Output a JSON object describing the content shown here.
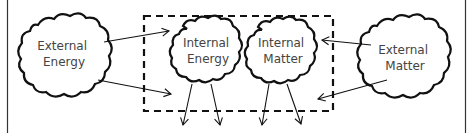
{
  "diagram": {
    "nodes": [
      {
        "id": "external-energy",
        "lines": [
          "External",
          "Energy"
        ]
      },
      {
        "id": "internal-energy",
        "lines": [
          "Internal",
          "Energy"
        ]
      },
      {
        "id": "internal-matter",
        "lines": [
          "Internal",
          "Matter"
        ]
      },
      {
        "id": "external-matter",
        "lines": [
          "External",
          "Matter"
        ]
      }
    ],
    "colors": {
      "stroke": "#111111",
      "text": "#444444",
      "background": "#ffffff"
    }
  }
}
